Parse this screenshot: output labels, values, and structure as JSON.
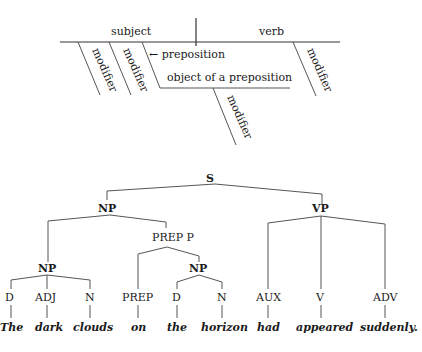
{
  "reed_kellogg": {
    "subject": "subject",
    "verb": "verb",
    "modifier_1": "modifier",
    "modifier_2": "modifier",
    "modifier_3": "modifier",
    "modifier_4": "modifier",
    "preposition": "← preposition",
    "object_of_preposition": "object of a preposition"
  },
  "tree": {
    "S": "S",
    "NP_top": "NP",
    "VP": "VP",
    "NP_inner": "NP",
    "PREP_P": "PREP  P",
    "NP_pp": "NP",
    "leaves": [
      {
        "tag": "D",
        "word": "The"
      },
      {
        "tag": "ADJ",
        "word": "dark"
      },
      {
        "tag": "N",
        "word": "clouds"
      },
      {
        "tag": "PREP",
        "word": "on"
      },
      {
        "tag": "D",
        "word": "the"
      },
      {
        "tag": "N",
        "word": "horizon"
      },
      {
        "tag": "AUX",
        "word": "had"
      },
      {
        "tag": "V",
        "word": "appeared"
      },
      {
        "tag": "ADV",
        "word": "suddenly."
      }
    ]
  }
}
